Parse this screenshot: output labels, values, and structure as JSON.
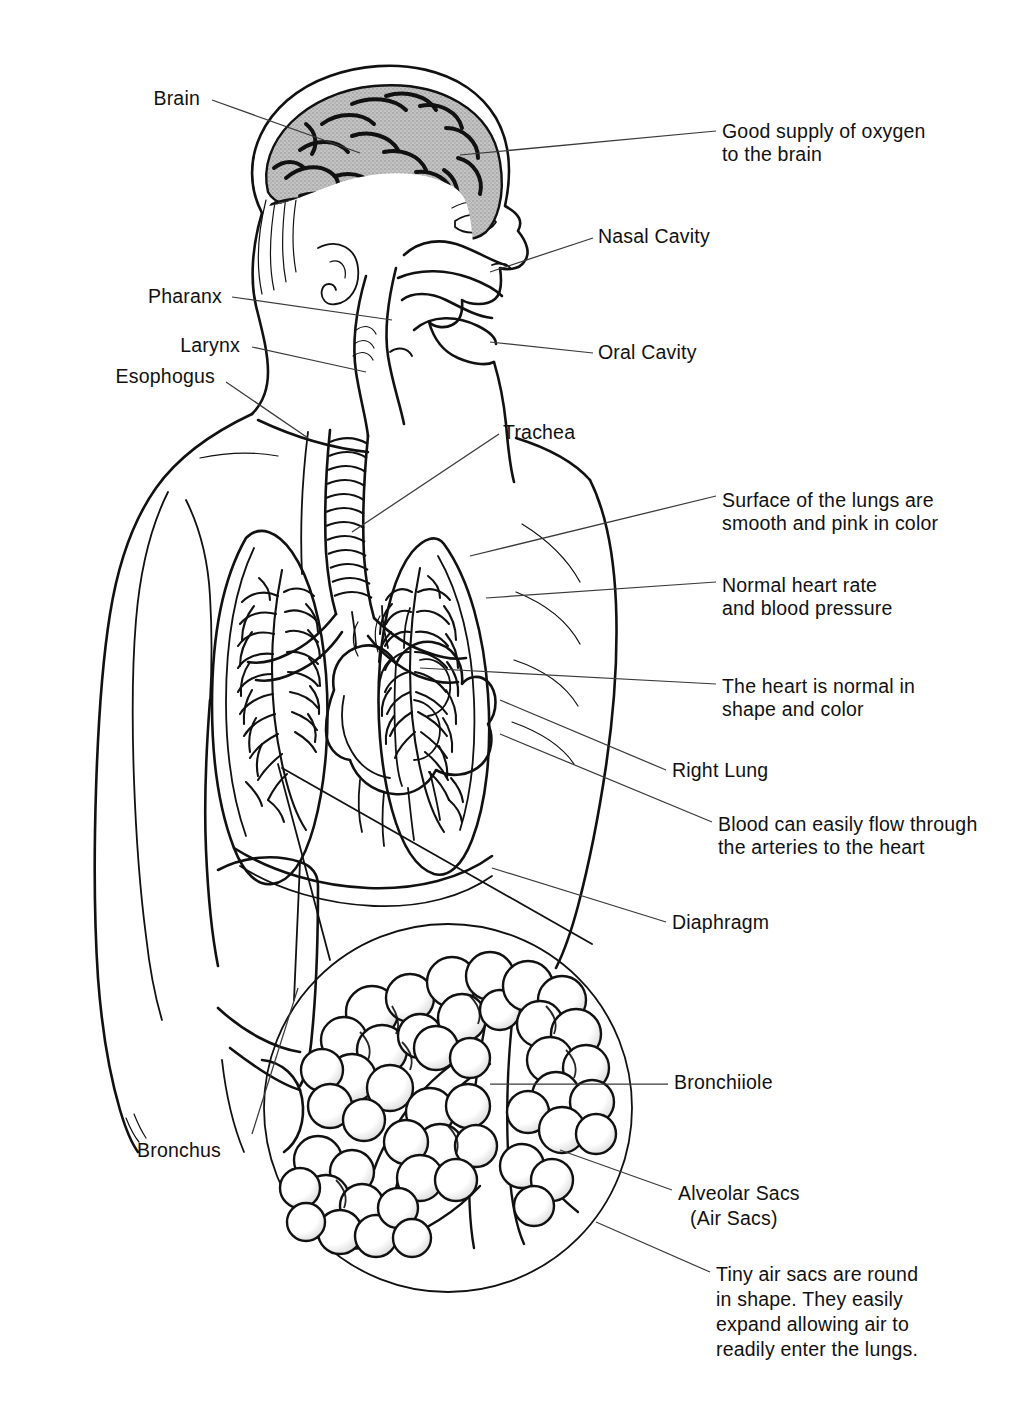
{
  "figure": {
    "background_color": "#ffffff",
    "ink_color": "#111111",
    "brain_fill_color": "#b9b9b9",
    "cerebellum_fill_color": "#4a4a4a",
    "leader_color": "#3a3a3a"
  },
  "labels": {
    "brain": "Brain",
    "good_oxygen": "Good supply of oxygen\nto the brain",
    "good_oxygen_line1": "Good supply of oxygen",
    "good_oxygen_line2": "to the brain",
    "nasal_cavity": "Nasal Cavity",
    "pharanx": "Pharanx",
    "larynx": "Larynx",
    "esophogus": "Esophogus",
    "oral_cavity": "Oral Cavity",
    "trachea": "Trachea",
    "lung_surface_line1": "Surface of the lungs are",
    "lung_surface_line2": "smooth and pink in color",
    "heart_rate_line1": "Normal heart rate",
    "heart_rate_line2": "and blood pressure",
    "heart_normal_line1": "The heart is normal in",
    "heart_normal_line2": "shape and color",
    "right_lung": "Right Lung",
    "blood_flow_line1": "Blood can easily flow through",
    "blood_flow_line2": "the arteries to the heart",
    "diaphragm": "Diaphragm",
    "bronchiiole": "Bronchiiole",
    "bronchus": "Bronchus",
    "alveolar_sacs_line1": "Alveolar Sacs",
    "alveolar_sacs_line2": "(Air Sacs)",
    "tiny_air_sacs_line1": "Tiny air sacs are round",
    "tiny_air_sacs_line2": "in shape. They easily",
    "tiny_air_sacs_line3": "expand allowing air to",
    "tiny_air_sacs_line4": "readily enter the lungs."
  },
  "annotations": [
    {
      "id": "brain",
      "text": "Brain",
      "align": "right",
      "x": 200,
      "y": 105
    },
    {
      "id": "good-oxygen",
      "text": "Good supply of oxygen to the brain",
      "align": "left",
      "x": 722,
      "y": 138
    },
    {
      "id": "nasal-cavity",
      "text": "Nasal Cavity",
      "align": "left",
      "x": 598,
      "y": 243
    },
    {
      "id": "pharanx",
      "text": "Pharanx",
      "align": "right",
      "x": 222,
      "y": 303
    },
    {
      "id": "larynx",
      "text": "Larynx",
      "align": "right",
      "x": 240,
      "y": 352
    },
    {
      "id": "esophogus",
      "text": "Esophogus",
      "align": "right",
      "x": 215,
      "y": 383
    },
    {
      "id": "oral-cavity",
      "text": "Oral Cavity",
      "align": "left",
      "x": 598,
      "y": 359
    },
    {
      "id": "trachea",
      "text": "Trachea",
      "align": "left",
      "x": 503,
      "y": 439
    },
    {
      "id": "lung-surface",
      "text": "Surface of the lungs are smooth and pink in color",
      "align": "left",
      "x": 722,
      "y": 507
    },
    {
      "id": "heart-rate",
      "text": "Normal heart rate and blood pressure",
      "align": "left",
      "x": 722,
      "y": 592
    },
    {
      "id": "heart-normal",
      "text": "The heart is normal in shape and color",
      "align": "left",
      "x": 722,
      "y": 693
    },
    {
      "id": "right-lung",
      "text": "Right Lung",
      "align": "left",
      "x": 672,
      "y": 777
    },
    {
      "id": "blood-flow",
      "text": "Blood can easily flow through the arteries to the heart",
      "align": "left",
      "x": 718,
      "y": 831
    },
    {
      "id": "diaphragm",
      "text": "Diaphragm",
      "align": "left",
      "x": 672,
      "y": 929
    },
    {
      "id": "bronchiiole",
      "text": "Bronchiiole",
      "align": "left",
      "x": 674,
      "y": 1089
    },
    {
      "id": "bronchus",
      "text": "Bronchus",
      "align": "left",
      "x": 137,
      "y": 1157
    },
    {
      "id": "alveolar-sacs",
      "text": "Alveolar Sacs (Air Sacs)",
      "align": "left",
      "x": 678,
      "y": 1200
    },
    {
      "id": "tiny-air-sacs",
      "text": "Tiny air sacs are round in shape. They easily expand allowing air to readily enter the lungs.",
      "align": "left",
      "x": 716,
      "y": 1281
    }
  ]
}
